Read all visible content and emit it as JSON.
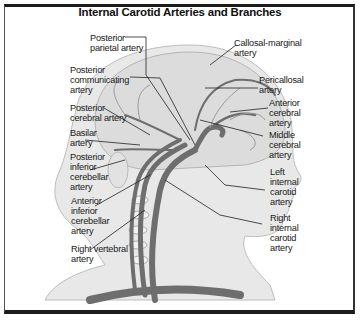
{
  "title": "Internal Carotid Arteries and Branches",
  "labels": {
    "posterior_parietal": "Posterior\nparietal artery",
    "posterior_communicating": "Posterior\ncommunicating\nartery",
    "posterior_cerebral": "Posterior\ncerebral artery",
    "basilar": "Basilar\nartery",
    "posterior_inferior_cerebellar": "Posterior\ninferior\ncerebellar\nartery",
    "anterior_inferior_cerebellar": "Anterior\ninferior\ncerebellar\nartery",
    "right_vertebral": "Right vertebral\nartery",
    "callosal_marginal": "Callosal-marginal\nartery",
    "pericallosal": "Pericallosal\nartery",
    "anterior_cerebral": "Anterior\ncerebral\nartery",
    "middle_cerebral": "Middle\ncerebral\nartery",
    "left_internal_carotid": "Left\ninternal\ncarotid\nartery",
    "right_internal_carotid": "Right\ninternal\ncarotid\nartery"
  },
  "colors": {
    "artery": "#6e6e6e",
    "head_fill": "#e6e6e6",
    "brain_fill": "#d9d9d9",
    "leader_line": "#222222"
  }
}
